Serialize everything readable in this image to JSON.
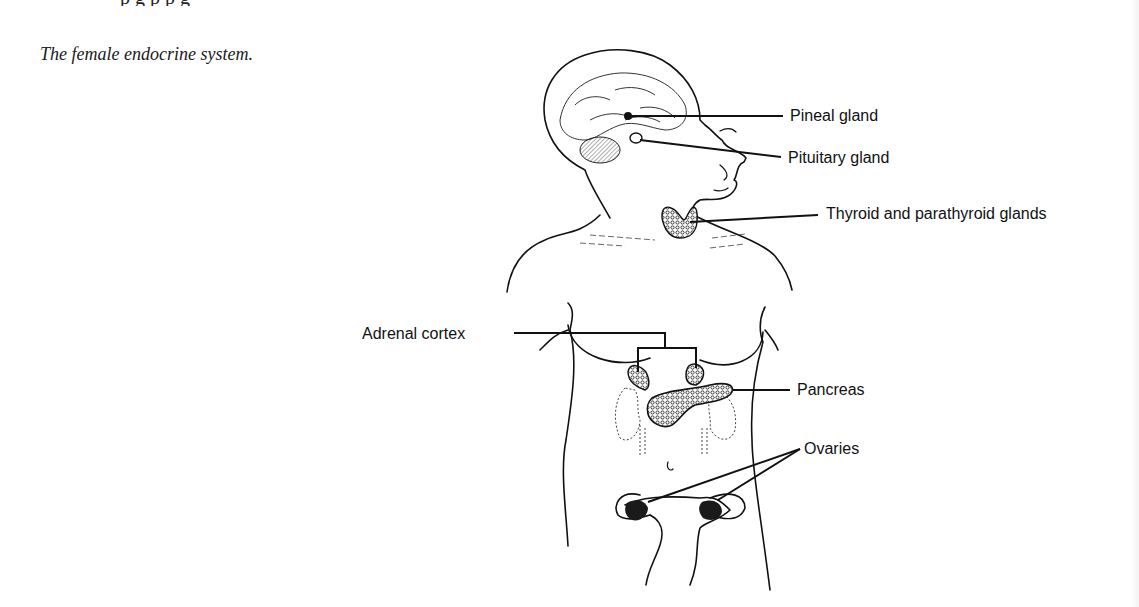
{
  "page": {
    "caption": "The female endocrine system.",
    "top_text_fragment": "p g p p g"
  },
  "figure": {
    "labels": {
      "pineal": "Pineal gland",
      "pituitary": "Pituitary gland",
      "thyroid": "Thyroid and parathyroid glands",
      "adrenal": "Adrenal cortex",
      "pancreas": "Pancreas",
      "ovaries": "Ovaries"
    },
    "colors": {
      "ink": "#111111",
      "gland_fill": "#6a6a6a",
      "background": "#ffffff"
    }
  }
}
